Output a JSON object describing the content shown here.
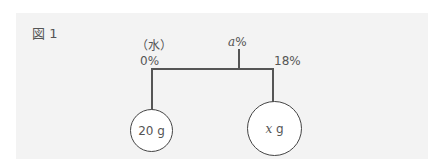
{
  "figure": {
    "label": "図 1",
    "water_label": "（水）",
    "left_percent": "0%",
    "middle_var": "a",
    "middle_percent": "%",
    "right_percent": "18%",
    "left_weight": "20 g",
    "right_var": "x",
    "right_unit": " g"
  }
}
